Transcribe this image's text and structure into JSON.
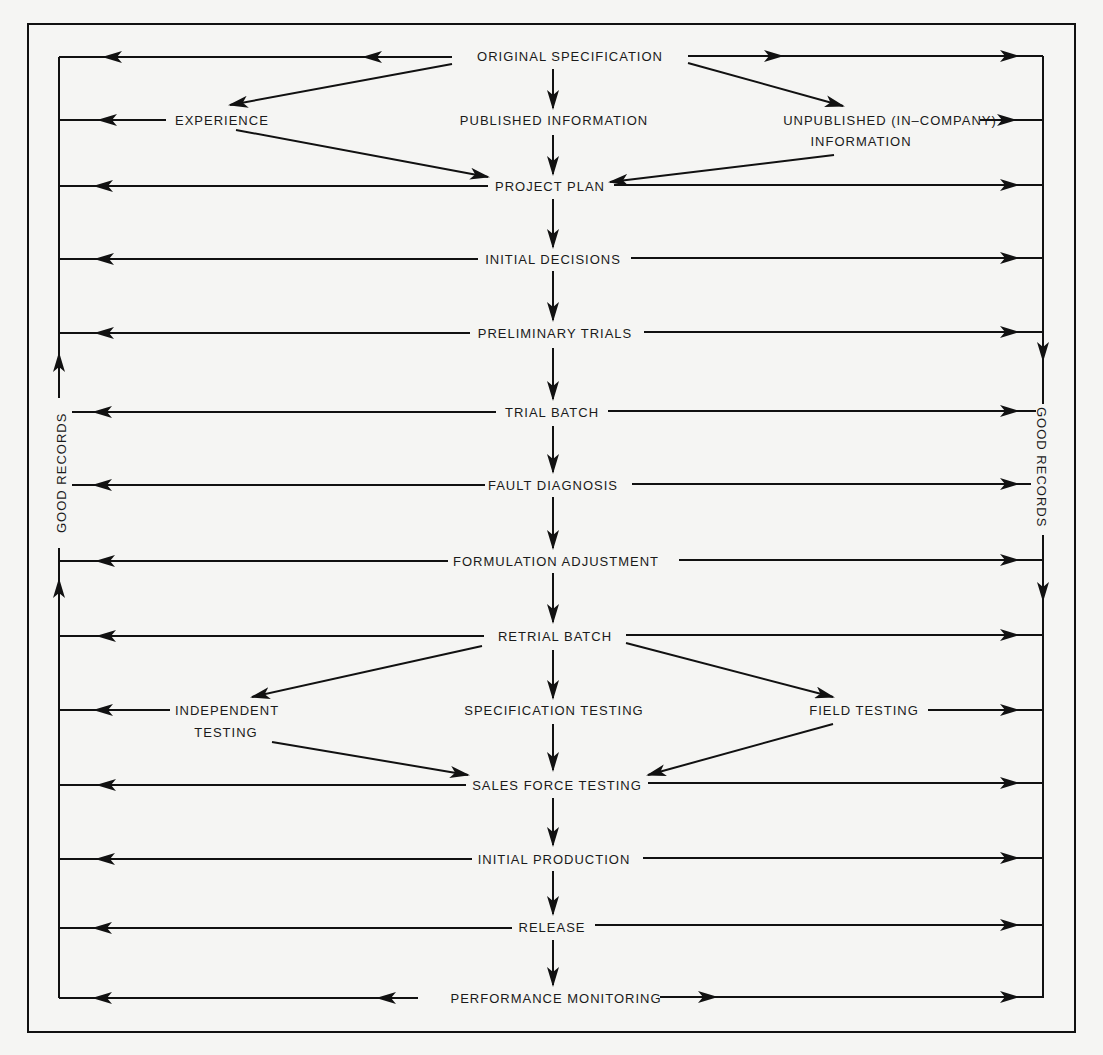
{
  "diagram": {
    "title": "",
    "nodes": {
      "original_specification": "ORIGINAL SPECIFICATION",
      "experience": "EXPERIENCE",
      "published_information": "PUBLISHED INFORMATION",
      "unpublished_line1": "UNPUBLISHED (IN–COMPANY)",
      "unpublished_line2": "INFORMATION",
      "project_plan": "PROJECT PLAN",
      "initial_decisions": "INITIAL DECISIONS",
      "preliminary_trials": "PRELIMINARY TRIALS",
      "trial_batch": "TRIAL BATCH",
      "fault_diagnosis": "FAULT DIAGNOSIS",
      "formulation_adjustment": "FORMULATION ADJUSTMENT",
      "retrial_batch": "RETRIAL BATCH",
      "independent_line1": "INDEPENDENT",
      "independent_line2": "TESTING",
      "specification_testing": "SPECIFICATION  TESTING",
      "field_testing": "FIELD TESTING",
      "sales_force_testing": "SALES FORCE TESTING",
      "initial_production": "INITIAL PRODUCTION",
      "release": "RELEASE",
      "performance_monitoring": "PERFORMANCE MONITORING"
    },
    "side_labels": {
      "left": "GOOD RECORDS",
      "right": "GOOD RECORDS"
    },
    "edges": [
      {
        "from": "ORIGINAL SPECIFICATION",
        "to": "EXPERIENCE"
      },
      {
        "from": "ORIGINAL SPECIFICATION",
        "to": "PUBLISHED INFORMATION"
      },
      {
        "from": "ORIGINAL SPECIFICATION",
        "to": "UNPUBLISHED (IN-COMPANY) INFORMATION"
      },
      {
        "from": "EXPERIENCE",
        "to": "PROJECT PLAN"
      },
      {
        "from": "PUBLISHED INFORMATION",
        "to": "PROJECT PLAN"
      },
      {
        "from": "UNPUBLISHED (IN-COMPANY) INFORMATION",
        "to": "PROJECT PLAN"
      },
      {
        "from": "PROJECT PLAN",
        "to": "INITIAL DECISIONS"
      },
      {
        "from": "INITIAL DECISIONS",
        "to": "PRELIMINARY TRIALS"
      },
      {
        "from": "PRELIMINARY TRIALS",
        "to": "TRIAL BATCH"
      },
      {
        "from": "TRIAL BATCH",
        "to": "FAULT DIAGNOSIS"
      },
      {
        "from": "FAULT DIAGNOSIS",
        "to": "FORMULATION ADJUSTMENT"
      },
      {
        "from": "FORMULATION ADJUSTMENT",
        "to": "RETRIAL BATCH"
      },
      {
        "from": "RETRIAL BATCH",
        "to": "INDEPENDENT TESTING"
      },
      {
        "from": "RETRIAL BATCH",
        "to": "SPECIFICATION TESTING"
      },
      {
        "from": "RETRIAL BATCH",
        "to": "FIELD TESTING"
      },
      {
        "from": "INDEPENDENT TESTING",
        "to": "SALES FORCE TESTING"
      },
      {
        "from": "SPECIFICATION TESTING",
        "to": "SALES FORCE TESTING"
      },
      {
        "from": "FIELD TESTING",
        "to": "SALES FORCE TESTING"
      },
      {
        "from": "SALES FORCE TESTING",
        "to": "INITIAL PRODUCTION"
      },
      {
        "from": "INITIAL PRODUCTION",
        "to": "RELEASE"
      },
      {
        "from": "RELEASE",
        "to": "PERFORMANCE MONITORING"
      },
      {
        "from": "every stage",
        "to": "GOOD RECORDS (left and right rails)"
      }
    ]
  }
}
